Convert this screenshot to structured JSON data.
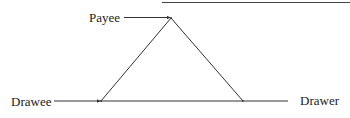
{
  "diagram": {
    "type": "triangle-relationship",
    "colors": {
      "line": "#333333",
      "text": "#222222",
      "background": "#ffffff"
    },
    "nodes": {
      "payee": {
        "label": "Payee"
      },
      "drawee": {
        "label": "Drawee"
      },
      "drawer": {
        "label": "Drawer"
      }
    },
    "edges": [
      {
        "from": "payee",
        "to": "apex",
        "kind": "arrow"
      },
      {
        "from": "drawee",
        "to": "left-vertex",
        "kind": "arrow"
      },
      {
        "from": "drawer",
        "to": "right-vertex",
        "kind": "arrow"
      },
      {
        "from": "apex",
        "to": "left-vertex",
        "kind": "line"
      },
      {
        "from": "apex",
        "to": "right-vertex",
        "kind": "line"
      },
      {
        "from": "left-vertex",
        "to": "right-vertex",
        "kind": "line"
      }
    ]
  }
}
